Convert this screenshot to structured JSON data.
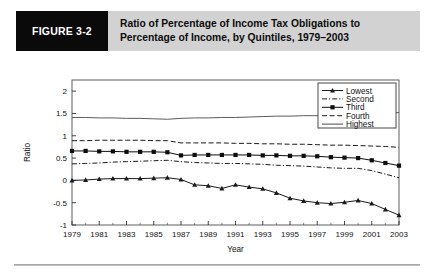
{
  "figure": {
    "tag": "FIGURE 3-2",
    "title_line1": "Ratio of Percentage of Income Tax Obligations to",
    "title_line2": "Percentage of Income, by Quintiles, 1979–2003",
    "tag_bg": "#0a0a0a",
    "band_bg": "#d2d2d2"
  },
  "chart_data": {
    "type": "line",
    "title": "Ratio of Percentage of Income Tax Obligations to Percentage of Income, by Quintiles, 1979–2003",
    "xlabel": "Year",
    "ylabel": "Ratio",
    "xlim": [
      1979,
      2003
    ],
    "ylim": [
      -1,
      2.25
    ],
    "yticks": [
      -1,
      -0.5,
      0,
      0.5,
      1,
      1.5,
      2
    ],
    "ytick_labels": [
      "-1",
      "-0.5",
      "0",
      "0.5",
      "1",
      "1.5",
      "2"
    ],
    "xticks": [
      1979,
      1981,
      1983,
      1985,
      1987,
      1989,
      1991,
      1993,
      1995,
      1997,
      1999,
      2001,
      2003
    ],
    "xtick_labels": [
      "1979",
      "1981",
      "1983",
      "1985",
      "1987",
      "1989",
      "1991",
      "1993",
      "1995",
      "1997",
      "1999",
      "2001",
      "2003"
    ],
    "grid": false,
    "legend_position": "top-right",
    "x": [
      1979,
      1980,
      1981,
      1982,
      1983,
      1984,
      1985,
      1986,
      1987,
      1988,
      1989,
      1990,
      1991,
      1992,
      1993,
      1994,
      1995,
      1996,
      1997,
      1998,
      1999,
      2000,
      2001,
      2002,
      2003
    ],
    "series": [
      {
        "name": "Lowest",
        "marker": "triangle",
        "dash": "none",
        "color": "#1a1a1a",
        "values": [
          0.0,
          0.01,
          0.03,
          0.04,
          0.04,
          0.04,
          0.05,
          0.06,
          0.02,
          -0.1,
          -0.12,
          -0.18,
          -0.1,
          -0.15,
          -0.19,
          -0.28,
          -0.4,
          -0.46,
          -0.5,
          -0.52,
          -0.49,
          -0.45,
          -0.52,
          -0.65,
          -0.78
        ]
      },
      {
        "name": "Second",
        "marker": "none",
        "dash": "dashdot",
        "color": "#1a1a1a",
        "values": [
          0.37,
          0.38,
          0.39,
          0.41,
          0.42,
          0.43,
          0.44,
          0.45,
          0.42,
          0.4,
          0.39,
          0.38,
          0.38,
          0.37,
          0.36,
          0.34,
          0.33,
          0.32,
          0.3,
          0.28,
          0.27,
          0.27,
          0.22,
          0.14,
          0.06
        ]
      },
      {
        "name": "Third",
        "marker": "square",
        "dash": "none",
        "color": "#0d0d0d",
        "values": [
          0.66,
          0.66,
          0.65,
          0.65,
          0.64,
          0.64,
          0.64,
          0.63,
          0.56,
          0.57,
          0.57,
          0.57,
          0.57,
          0.57,
          0.56,
          0.56,
          0.55,
          0.55,
          0.54,
          0.52,
          0.51,
          0.5,
          0.45,
          0.39,
          0.33
        ]
      },
      {
        "name": "Fourth",
        "marker": "none",
        "dash": "dashed",
        "color": "#1a1a1a",
        "values": [
          0.89,
          0.89,
          0.9,
          0.9,
          0.9,
          0.9,
          0.89,
          0.89,
          0.84,
          0.84,
          0.84,
          0.84,
          0.83,
          0.83,
          0.82,
          0.82,
          0.81,
          0.81,
          0.8,
          0.79,
          0.79,
          0.78,
          0.77,
          0.76,
          0.74
        ]
      },
      {
        "name": "Highest",
        "marker": "none",
        "dash": "none",
        "color": "#4a4a4a",
        "values": [
          1.41,
          1.41,
          1.4,
          1.4,
          1.39,
          1.39,
          1.38,
          1.37,
          1.39,
          1.4,
          1.4,
          1.41,
          1.41,
          1.42,
          1.43,
          1.44,
          1.44,
          1.45,
          1.45,
          1.44,
          1.43,
          1.44,
          1.47,
          1.5,
          1.52
        ]
      }
    ]
  }
}
